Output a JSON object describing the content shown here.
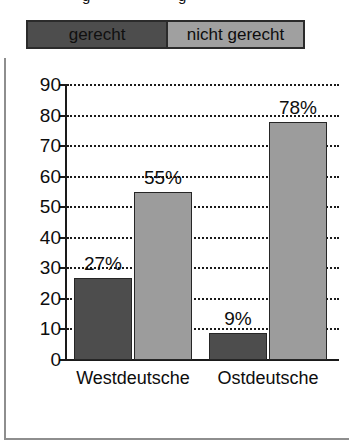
{
  "clipped_caption": {
    "fragment_left": "g",
    "fragment_right": "g"
  },
  "legend": {
    "items": [
      {
        "label": "gerecht",
        "color": "#4d4d4d"
      },
      {
        "label": "nicht gerecht",
        "color": "#a0a0a0"
      }
    ]
  },
  "chart_data": {
    "type": "bar",
    "title": "",
    "xlabel": "",
    "ylabel": "",
    "categories": [
      "Westdeutsche",
      "Ostdeutsche"
    ],
    "series": [
      {
        "name": "gerecht",
        "color": "#4d4d4d",
        "values": [
          27,
          9
        ],
        "labels": [
          "27%",
          "9%"
        ]
      },
      {
        "name": "nicht gerecht",
        "color": "#9c9c9c",
        "values": [
          55,
          78
        ],
        "labels": [
          "55%",
          "78%"
        ]
      }
    ],
    "ylim": [
      0,
      90
    ],
    "ytick_step": 10,
    "yticks": [
      90,
      80,
      70,
      60,
      50,
      40,
      30,
      20,
      10,
      0
    ],
    "ytick_labels": [
      "90",
      "80",
      "70",
      "60",
      "50",
      "40",
      "30",
      "20",
      "10",
      "0"
    ],
    "grid": true,
    "grid_style": "dotted",
    "legend_position": "top"
  }
}
